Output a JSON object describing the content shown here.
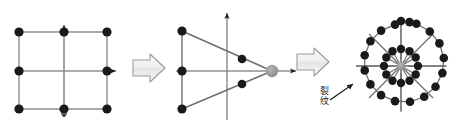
{
  "figure": {
    "title": "",
    "panel_count": 3,
    "background_color": "#ffffff",
    "node_color": "#1a1a1a",
    "hub_color": "#8c8c8c",
    "edge_color": "#808080",
    "arrow_fill": "#f0f0f0",
    "arrow_stroke": "#9a9a9a"
  },
  "panel_left": {
    "name": "square-lattice-panel",
    "description": "3x3 square lattice of nodes with cross axes",
    "node_count": 8,
    "nodes": [
      {
        "id": "n-tl",
        "x": 19,
        "y": 32
      },
      {
        "id": "n-tm",
        "x": 64,
        "y": 32
      },
      {
        "id": "n-tr",
        "x": 107,
        "y": 32
      },
      {
        "id": "n-ml",
        "x": 19,
        "y": 71
      },
      {
        "id": "n-mr",
        "x": 107,
        "y": 71
      },
      {
        "id": "n-bl",
        "x": 19,
        "y": 109
      },
      {
        "id": "n-bm",
        "x": 64,
        "y": 109
      },
      {
        "id": "n-br",
        "x": 107,
        "y": 109
      }
    ],
    "axis_arrows": [
      {
        "id": "axis-arrow-up",
        "direction": "up"
      },
      {
        "id": "axis-arrow-right",
        "direction": "right"
      }
    ]
  },
  "arrow_1": {
    "name": "transition-arrow-1",
    "label": "",
    "direction": "right"
  },
  "panel_middle": {
    "name": "triangular-wedge-panel",
    "description": "Wedge / triangle configuration collapsing toward a gray focus node on the horizontal axis",
    "node_count": 6,
    "nodes": [
      {
        "id": "m-tl",
        "x": 182,
        "y": 31,
        "type": "black"
      },
      {
        "id": "m-ml",
        "x": 182,
        "y": 71,
        "type": "black"
      },
      {
        "id": "m-bl",
        "x": 182,
        "y": 109,
        "type": "black"
      },
      {
        "id": "m-iu",
        "x": 242,
        "y": 59,
        "type": "black"
      },
      {
        "id": "m-id",
        "x": 242,
        "y": 84,
        "type": "black"
      },
      {
        "id": "m-focus",
        "x": 272,
        "y": 71,
        "type": "gray-hub"
      }
    ],
    "axis_arrows": [
      {
        "id": "axis-arrow-up",
        "direction": "up"
      },
      {
        "id": "axis-arrow-right",
        "direction": "right"
      }
    ]
  },
  "arrow_2": {
    "name": "transition-arrow-2",
    "label": "",
    "direction": "right"
  },
  "annotation": {
    "name": "crack-annotation",
    "text": "裂\n纹",
    "text_plain": "裂纹",
    "meaning": "crack",
    "pointer": "arrow-up-right"
  },
  "panel_right": {
    "name": "radial-wheel-panel",
    "description": "Radial hub-and-spoke network: gray star hub, inner ring of nodes, outer ring of nodes",
    "hub": {
      "id": "r-hub",
      "x": 401,
      "y": 66,
      "type": "gray-star-hub"
    },
    "inner_ring": {
      "count": 12,
      "radius": 17,
      "node_type": "black"
    },
    "outer_ring": {
      "count": 18,
      "radius": 45,
      "node_type": "black"
    },
    "spokes": 8,
    "axis_lines": [
      "horizontal",
      "vertical"
    ]
  }
}
